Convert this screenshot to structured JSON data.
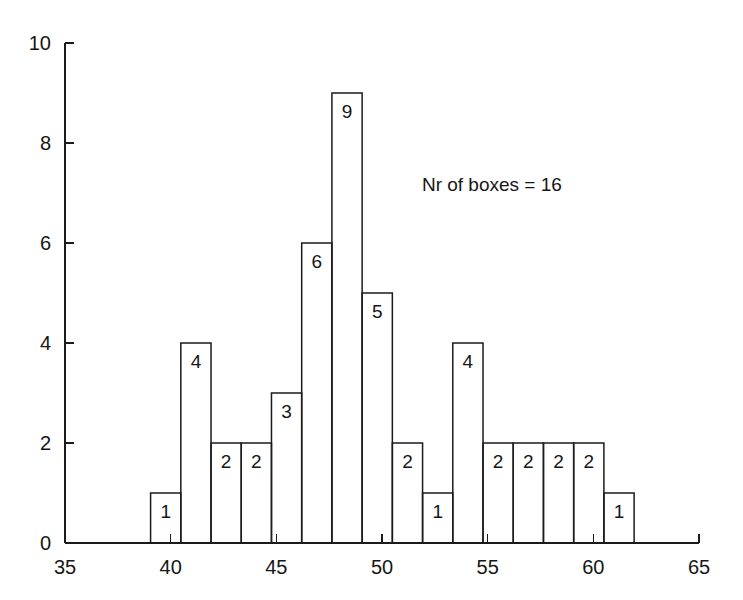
{
  "chart_data": {
    "type": "bar",
    "title": "",
    "subtitle": "",
    "xlabel": "",
    "ylabel": "",
    "xlim": [
      35,
      65
    ],
    "ylim": [
      0,
      10
    ],
    "grid": false,
    "legend": "none",
    "x_ticks": [
      "35",
      "40",
      "45",
      "50",
      "55",
      "60",
      "65"
    ],
    "x_tick_values": [
      35,
      40,
      45,
      50,
      55,
      60,
      65
    ],
    "y_ticks": [
      "0",
      "2",
      "4",
      "6",
      "8",
      "10"
    ],
    "y_tick_values": [
      0,
      2,
      4,
      6,
      8,
      10
    ],
    "bin_width": 1.43,
    "bin_starts": [
      39.05,
      40.48,
      41.91,
      43.34,
      44.77,
      46.2,
      47.63,
      49.06,
      50.49,
      51.92,
      53.35,
      54.78,
      56.21,
      57.64,
      59.07,
      60.5
    ],
    "values": [
      1,
      4,
      2,
      2,
      3,
      6,
      9,
      5,
      2,
      1,
      4,
      2,
      2,
      2,
      2,
      1
    ],
    "bar_labels": [
      "1",
      "4",
      "2",
      "2",
      "3",
      "6",
      "9",
      "5",
      "2",
      "1",
      "4",
      "2",
      "2",
      "2",
      "2",
      "1"
    ],
    "annotations": [
      {
        "text": "Nr of boxes = 16",
        "x": 55.2,
        "y": 7.05
      }
    ],
    "colors": {
      "bar_stroke": "#1b1b1b",
      "bar_fill": "none",
      "axis": "#1b1b1b",
      "background": "#ffffff",
      "text": "#161616"
    }
  },
  "annotation": {
    "boxes_note": "Nr of boxes = 16"
  }
}
